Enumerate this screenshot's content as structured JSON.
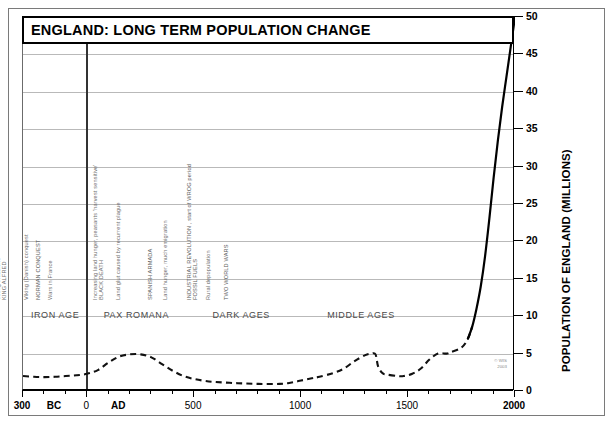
{
  "title": "ENGLAND: LONG TERM POPULATION CHANGE",
  "credit_line1": "© WIS",
  "credit_line2": "2003",
  "chart_data": {
    "type": "line",
    "title": "ENGLAND: LONG TERM POPULATION CHANGE",
    "xlabel": "",
    "ylabel": "POPULATION OF ENGLAND (MILLIONS)",
    "xlim": [
      -300,
      2000
    ],
    "ylim": [
      0,
      50
    ],
    "grid": true,
    "legend": "none",
    "x_ticks_major": [
      -300,
      0,
      500,
      1000,
      1500,
      2000
    ],
    "x_tick_labels": [
      "300",
      "0",
      "500",
      "1000",
      "1500",
      "2000"
    ],
    "x_tick_minor_step": 100,
    "x_era_markers": [
      {
        "label": "BC",
        "x": -150
      },
      {
        "label": "AD",
        "x": 150
      }
    ],
    "y_ticks": [
      0,
      5,
      10,
      15,
      20,
      25,
      30,
      35,
      40,
      45,
      50
    ],
    "y_tick_labels": [
      "0",
      "5",
      "10",
      "15",
      "20",
      "25",
      "30",
      "35",
      "40",
      "45",
      "50"
    ],
    "series": [
      {
        "name": "Population of England (millions)",
        "style_historic": "dashed",
        "style_modern": "solid",
        "solid_from_year": 1800,
        "points": [
          {
            "x": -300,
            "y": 2.0
          },
          {
            "x": -250,
            "y": 1.9
          },
          {
            "x": -200,
            "y": 1.85
          },
          {
            "x": -150,
            "y": 1.9
          },
          {
            "x": -100,
            "y": 2.0
          },
          {
            "x": -50,
            "y": 2.1
          },
          {
            "x": 0,
            "y": 2.3
          },
          {
            "x": 50,
            "y": 2.8
          },
          {
            "x": 100,
            "y": 3.8
          },
          {
            "x": 150,
            "y": 4.6
          },
          {
            "x": 200,
            "y": 4.9
          },
          {
            "x": 250,
            "y": 4.9
          },
          {
            "x": 300,
            "y": 4.5
          },
          {
            "x": 350,
            "y": 3.6
          },
          {
            "x": 400,
            "y": 2.7
          },
          {
            "x": 450,
            "y": 2.0
          },
          {
            "x": 500,
            "y": 1.6
          },
          {
            "x": 550,
            "y": 1.35
          },
          {
            "x": 600,
            "y": 1.2
          },
          {
            "x": 700,
            "y": 1.05
          },
          {
            "x": 800,
            "y": 0.95
          },
          {
            "x": 900,
            "y": 0.95
          },
          {
            "x": 950,
            "y": 1.1
          },
          {
            "x": 1000,
            "y": 1.4
          },
          {
            "x": 1050,
            "y": 1.7
          },
          {
            "x": 1086,
            "y": 1.9
          },
          {
            "x": 1150,
            "y": 2.4
          },
          {
            "x": 1200,
            "y": 3.0
          },
          {
            "x": 1250,
            "y": 4.0
          },
          {
            "x": 1300,
            "y": 4.8
          },
          {
            "x": 1330,
            "y": 5.0
          },
          {
            "x": 1348,
            "y": 4.9
          },
          {
            "x": 1360,
            "y": 3.3
          },
          {
            "x": 1380,
            "y": 2.4
          },
          {
            "x": 1400,
            "y": 2.2
          },
          {
            "x": 1450,
            "y": 2.0
          },
          {
            "x": 1480,
            "y": 2.0
          },
          {
            "x": 1520,
            "y": 2.3
          },
          {
            "x": 1560,
            "y": 3.0
          },
          {
            "x": 1600,
            "y": 4.2
          },
          {
            "x": 1640,
            "y": 5.0
          },
          {
            "x": 1680,
            "y": 5.0
          },
          {
            "x": 1700,
            "y": 5.2
          },
          {
            "x": 1750,
            "y": 5.8
          },
          {
            "x": 1780,
            "y": 7.0
          },
          {
            "x": 1800,
            "y": 8.6
          },
          {
            "x": 1820,
            "y": 11.0
          },
          {
            "x": 1840,
            "y": 14.0
          },
          {
            "x": 1860,
            "y": 18.0
          },
          {
            "x": 1880,
            "y": 23.0
          },
          {
            "x": 1900,
            "y": 28.5
          },
          {
            "x": 1920,
            "y": 33.5
          },
          {
            "x": 1940,
            "y": 38.0
          },
          {
            "x": 1960,
            "y": 42.0
          },
          {
            "x": 1980,
            "y": 46.0
          },
          {
            "x": 2000,
            "y": 50.0
          }
        ]
      }
    ],
    "eras": [
      {
        "label": "IRON AGE",
        "x_center": -150
      },
      {
        "label": "PAX ROMANA",
        "x_center": 230
      },
      {
        "label": "DARK AGES",
        "x_center": 720
      },
      {
        "label": "MIDDLE AGES",
        "x_center": 1280
      }
    ],
    "annotations": [
      {
        "label": "Warring Celtic tribes",
        "x": -205,
        "emphasis": "normal"
      },
      {
        "label": "ROMANS ARRIVE",
        "x": 43,
        "emphasis": "caps"
      },
      {
        "label": "Golden Age of Roman Civilisation",
        "x": 205,
        "emphasis": "normal"
      },
      {
        "label": "ROMANS DEPART",
        "x": 410,
        "emphasis": "caps"
      },
      {
        "label": "Anglo-Saxon invasions and settlement",
        "x": 465,
        "emphasis": "normal"
      },
      {
        "label": "Depopulation as Britons flee west to escape massacres",
        "x": 520,
        "emphasis": "normal"
      },
      {
        "label": "Many tribal kingdoms, seldom at peace,",
        "label2": "largely illiterate, wealthy warlords",
        "x": 700,
        "emphasis": "normal"
      },
      {
        "label": "Viking invasions",
        "label2": "KING ALFRED",
        "x": 880,
        "emphasis": "normal"
      },
      {
        "label": "Viking (Danish) conquest",
        "x": 1010,
        "emphasis": "normal"
      },
      {
        "label": "NORMAN CONQUEST",
        "x": 1066,
        "emphasis": "caps"
      },
      {
        "label": "Wars in France",
        "x": 1120,
        "emphasis": "normal"
      },
      {
        "label": "Increasing land hunger, peasants 'harvest sensitive'",
        "label2": "BLACK DEATH",
        "x": 1330,
        "emphasis": "normal"
      },
      {
        "label": "Land glut caused by recurrent plague",
        "x": 1440,
        "emphasis": "normal"
      },
      {
        "label": "SPANISH ARMADA",
        "x": 1588,
        "emphasis": "caps"
      },
      {
        "label": "Land hunger, much emigration",
        "x": 1660,
        "emphasis": "normal"
      },
      {
        "label": "INDUSTRIAL REVOLUTION , start of WROG period",
        "x": 1770,
        "emphasis": "caps"
      },
      {
        "label": "FOSSIL FUELS",
        "x": 1800,
        "emphasis": "caps"
      },
      {
        "label": "Rural depopulation",
        "x": 1860,
        "emphasis": "normal"
      },
      {
        "label": "TWO WORLD WARS",
        "x": 1945,
        "emphasis": "caps"
      }
    ]
  }
}
